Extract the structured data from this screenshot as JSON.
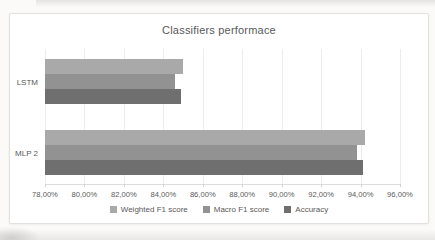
{
  "chart_data": {
    "type": "bar",
    "orientation": "horizontal",
    "title": "Classifiers performace",
    "categories": [
      "LSTM",
      "MLP 2"
    ],
    "series": [
      {
        "name": "Weighted F1 score",
        "color": "#a9a9a9",
        "values": [
          85.0,
          94.2
        ]
      },
      {
        "name": "Macro F1 score",
        "color": "#929292",
        "values": [
          84.6,
          93.8
        ]
      },
      {
        "name": "Accuracy",
        "color": "#6f6f6f",
        "values": [
          84.9,
          94.1
        ]
      }
    ],
    "x_axis": {
      "min": 78,
      "max": 96,
      "step": 2,
      "tick_labels": [
        "78,00%",
        "80,00%",
        "82,00%",
        "84,00%",
        "86,00%",
        "88,00%",
        "90,00%",
        "92,00%",
        "94,00%",
        "96,00%"
      ]
    },
    "grid": true,
    "legend_position": "bottom",
    "colors": {
      "title_text": "#595959",
      "axis_text": "#595959",
      "gridline": "#ececec",
      "chart_background": "#ffffff",
      "page_background": "#fbfaf9"
    }
  }
}
